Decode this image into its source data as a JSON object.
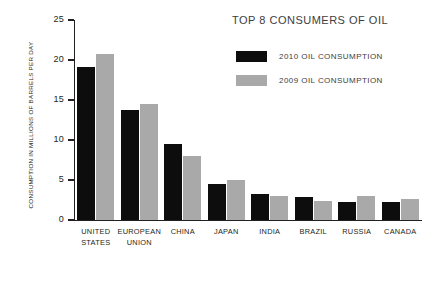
{
  "chart_data": {
    "type": "bar",
    "title": "TOP 8 CONSUMERS OF OIL",
    "xlabel": "",
    "ylabel": "CONSUMPTION IN MILLIONS OF BARRELS PER DAY",
    "ylim": [
      0,
      25
    ],
    "yticks": [
      25,
      20,
      15,
      10,
      5,
      0
    ],
    "ytick_labels": [
      "25",
      "20",
      "15",
      "10",
      "5",
      "0"
    ],
    "grid": false,
    "legend_position": "top-right",
    "categories": [
      "UNITED STATES",
      "EUROPEAN UNION",
      "CHINA",
      "JAPAN",
      "INDIA",
      "BRAZIL",
      "RUSSIA",
      "CANADA"
    ],
    "category_lines": [
      [
        "UNITED",
        "STATES"
      ],
      [
        "EUROPEAN",
        "UNION"
      ],
      [
        "CHINA"
      ],
      [
        "JAPAN"
      ],
      [
        "INDIA"
      ],
      [
        "BRAZIL"
      ],
      [
        "RUSSIA"
      ],
      [
        "CANADA"
      ]
    ],
    "series": [
      {
        "name": "2010 OIL CONSUMPTION",
        "color": "#0d0d0d",
        "values": [
          19.1,
          13.75,
          9.5,
          4.55,
          3.2,
          2.9,
          2.3,
          2.2
        ]
      },
      {
        "name": "2009 OIL CONSUMPTION",
        "color": "#a9a9a9",
        "values": [
          20.75,
          14.5,
          8.0,
          5.0,
          3.0,
          2.4,
          3.0,
          2.65
        ]
      }
    ]
  },
  "legend": {
    "items": [
      {
        "label": "2010 OIL CONSUMPTION",
        "color": "#0d0d0d"
      },
      {
        "label": "2009 OIL CONSUMPTION",
        "color": "#a9a9a9"
      }
    ]
  },
  "colors": {
    "axis": "#231f20",
    "text": "#231f20",
    "title_text": "#3d3d3d",
    "series_2010": "#0d0d0d",
    "series_2009": "#a9a9a9",
    "background": "#ffffff"
  }
}
